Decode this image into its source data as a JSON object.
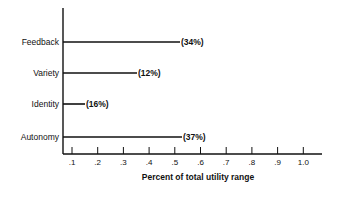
{
  "chart_data": {
    "type": "bar",
    "orientation": "horizontal",
    "title": "",
    "xlabel": "Percent of total utility range",
    "ylabel": "",
    "categories": [
      "Feedback",
      "Variety",
      "Identity",
      "Autonomy"
    ],
    "values": [
      34,
      12,
      16,
      37
    ],
    "value_labels": [
      "(34%)",
      "(12%)",
      "(16%)",
      "(37%)"
    ],
    "bar_end_positions": [
      0.15,
      0.08,
      0.03,
      0.15
    ],
    "x_ticks": [
      ".1",
      ".2",
      ".3",
      ".4",
      ".5",
      ".6",
      ".7",
      ".8",
      ".9",
      "1.0"
    ],
    "xlim": [
      0,
      1.0
    ],
    "grid": false,
    "legend": null,
    "bar_style": "line"
  }
}
